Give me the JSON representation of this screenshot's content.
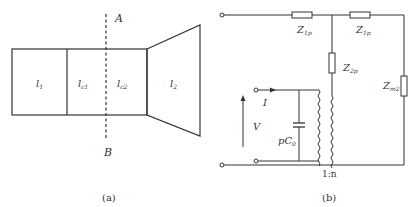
{
  "figure_a": {
    "section_labels": [
      {
        "main": "l",
        "sub": "1"
      },
      {
        "main": "l",
        "sub": "c1"
      },
      {
        "main": "l",
        "sub": "c2"
      },
      {
        "main": "l",
        "sub": "2"
      }
    ],
    "cut_top_label": "A",
    "cut_bottom_label": "B",
    "caption": "(a)"
  },
  "figure_b": {
    "series_left": {
      "main": "Z",
      "sub": "1p"
    },
    "series_right": {
      "main": "Z",
      "sub": "1p"
    },
    "shunt_middle": {
      "main": "Z",
      "sub": "2p"
    },
    "shunt_load": {
      "main": "Z",
      "sub": "m2"
    },
    "current_label": "I",
    "voltage_label": "V",
    "capacitor_label": {
      "main": "pC",
      "sub": "0"
    },
    "transformer_ratio": "1:n",
    "caption": "(b)"
  },
  "colors": {
    "line": "#333333",
    "background": "#ffffff"
  }
}
